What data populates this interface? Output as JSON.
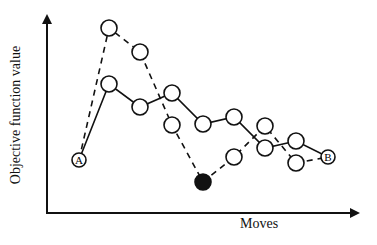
{
  "diagram": {
    "axes": {
      "y_label": "Objective function value",
      "x_label": "Moves"
    },
    "start_label": "A",
    "end_label": "B",
    "solid_path": [
      [
        79,
        160
      ],
      [
        109,
        84
      ],
      [
        140,
        107
      ],
      [
        172,
        93
      ],
      [
        203,
        124
      ],
      [
        234,
        117
      ],
      [
        265,
        148
      ],
      [
        296,
        141
      ],
      [
        328,
        157
      ]
    ],
    "dashed_path": [
      [
        79,
        160
      ],
      [
        109,
        28
      ],
      [
        140,
        52
      ],
      [
        172,
        125
      ],
      [
        203,
        182
      ],
      [
        234,
        157
      ],
      [
        265,
        126
      ],
      [
        296,
        163
      ],
      [
        328,
        157
      ]
    ],
    "filled_node_index": 4
  }
}
